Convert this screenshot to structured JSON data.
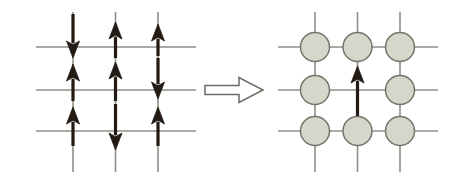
{
  "figure": {
    "width": 467,
    "height": 177,
    "background_color": "#ffffff"
  },
  "colors": {
    "lattice_line": "#8f8f86",
    "lattice_line_dark": "#6e6e66",
    "arrow_black": "#231a14",
    "circle_fill": "#d6d6cb",
    "circle_stroke": "#74746b",
    "hollow_arrow_stroke": "#6b6b63",
    "hollow_arrow_fill": "#ffffff",
    "background": "#ffffff"
  },
  "left_panel": {
    "name": "spin-lattice",
    "label": "Spin configuration lattice",
    "grid": {
      "columns": 3,
      "rows": 3,
      "vertical_line_x": [
        73,
        115.5,
        158
      ],
      "horizontal_line_y": [
        47,
        90,
        131
      ],
      "vertical_line_top": 12,
      "vertical_line_bottom": 172,
      "horizontal_line_left": 36,
      "horizontal_line_right": 196,
      "line_width": 1.6
    },
    "spins": [
      {
        "id": "spin-r0-c0",
        "column": 0,
        "band": "top",
        "direction": "down",
        "x": 73,
        "tail_y": 14,
        "head_y": 58
      },
      {
        "id": "spin-r0-c1",
        "column": 1,
        "band": "top",
        "direction": "up",
        "x": 115.5,
        "tail_y": 58,
        "head_y": 22
      },
      {
        "id": "spin-r0-c2",
        "column": 2,
        "band": "top",
        "direction": "up",
        "x": 158,
        "tail_y": 56,
        "head_y": 24
      },
      {
        "id": "spin-r1-c0",
        "column": 0,
        "band": "middle",
        "direction": "up",
        "x": 73,
        "tail_y": 101,
        "head_y": 64
      },
      {
        "id": "spin-r1-c1",
        "column": 1,
        "band": "middle",
        "direction": "up",
        "x": 115.5,
        "tail_y": 101,
        "head_y": 62
      },
      {
        "id": "spin-r1-c2",
        "column": 2,
        "band": "middle",
        "direction": "down",
        "x": 158,
        "tail_y": 58,
        "head_y": 99
      },
      {
        "id": "spin-r2-c0",
        "column": 0,
        "band": "bottom",
        "direction": "up",
        "x": 73,
        "tail_y": 146,
        "head_y": 107
      },
      {
        "id": "spin-r2-c1",
        "column": 1,
        "band": "bottom",
        "direction": "down",
        "x": 115.5,
        "tail_y": 104,
        "head_y": 150
      },
      {
        "id": "spin-r2-c2",
        "column": 2,
        "band": "bottom",
        "direction": "up",
        "x": 158,
        "tail_y": 146,
        "head_y": 107
      }
    ],
    "spin_pattern_rows": [
      [
        "down",
        "up",
        "up"
      ],
      [
        "up",
        "up",
        "down"
      ],
      [
        "up",
        "down",
        "up"
      ]
    ],
    "arrow_style": {
      "shaft_width": 3.2,
      "head_width": 13,
      "head_length": 17
    }
  },
  "transform_arrow": {
    "name": "implies-arrow",
    "glyph": "⟹",
    "label": "maps to",
    "direction": "right",
    "x": 205,
    "y": 90,
    "length": 58,
    "shaft_height": 9,
    "head_width": 24,
    "head_height": 25,
    "filled": false
  },
  "right_panel": {
    "name": "particle-lattice",
    "label": "Particle occupation lattice with one vacancy",
    "grid": {
      "columns": 3,
      "rows": 3,
      "vertical_line_x": [
        315,
        357.5,
        400
      ],
      "horizontal_line_y": [
        47,
        90,
        131
      ],
      "vertical_line_top": 12,
      "vertical_line_bottom": 172,
      "horizontal_line_left": 278,
      "horizontal_line_right": 438,
      "line_width": 1.6
    },
    "circle_radius": 14.5,
    "nodes": [
      {
        "id": "node-r0-c0",
        "row": 0,
        "column": 0,
        "cx": 315,
        "cy": 47,
        "occupied": true
      },
      {
        "id": "node-r0-c1",
        "row": 0,
        "column": 1,
        "cx": 357.5,
        "cy": 47,
        "occupied": true
      },
      {
        "id": "node-r0-c2",
        "row": 0,
        "column": 2,
        "cx": 400,
        "cy": 47,
        "occupied": true
      },
      {
        "id": "node-r1-c0",
        "row": 1,
        "column": 0,
        "cx": 315,
        "cy": 90,
        "occupied": true
      },
      {
        "id": "node-r1-c1",
        "row": 1,
        "column": 1,
        "cx": 357.5,
        "cy": 90,
        "occupied": false
      },
      {
        "id": "node-r1-c2",
        "row": 1,
        "column": 2,
        "cx": 400,
        "cy": 90,
        "occupied": true
      },
      {
        "id": "node-r2-c0",
        "row": 2,
        "column": 0,
        "cx": 315,
        "cy": 131,
        "occupied": true
      },
      {
        "id": "node-r2-c1",
        "row": 2,
        "column": 1,
        "cx": 357.5,
        "cy": 131,
        "occupied": true
      },
      {
        "id": "node-r2-c2",
        "row": 2,
        "column": 2,
        "cx": 400,
        "cy": 131,
        "occupied": true
      }
    ],
    "occupancy_rows": [
      [
        1,
        1,
        1
      ],
      [
        1,
        0,
        1
      ],
      [
        1,
        1,
        1
      ]
    ],
    "hop_arrow": {
      "id": "hop-arrow",
      "label": "particle hop into vacancy",
      "direction": "up",
      "x": 357.5,
      "tail_y": 116,
      "head_y": 66,
      "shaft_width": 3.2,
      "head_width": 13,
      "head_length": 17
    }
  }
}
